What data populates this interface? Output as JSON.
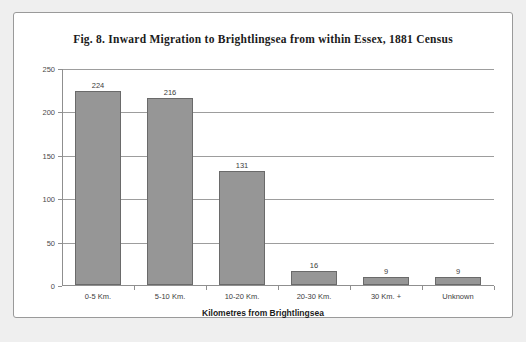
{
  "chart_data": {
    "type": "bar",
    "title": "Fig. 8. Inward Migration to Brightlingsea from within Essex, 1881 Census",
    "xlabel": "Kilometres from Brightlingsea",
    "ylabel": "",
    "categories": [
      "0-5 Km.",
      "5-10 Km.",
      "10-20 Km.",
      "20-30 Km.",
      "30 Km. +",
      "Unknown"
    ],
    "values": [
      224,
      216,
      131,
      16,
      9,
      9
    ],
    "value_labels": [
      "224",
      "216",
      "131",
      "16",
      "9",
      "9"
    ],
    "ylim": [
      0,
      250
    ],
    "yticks": [
      0,
      50,
      100,
      150,
      200,
      250
    ],
    "ytick_labels": [
      "0",
      "50",
      "100",
      "150",
      "200",
      "250"
    ],
    "grid": true,
    "legend": false,
    "bar_color": "#969696",
    "bar_border_color": "#6a6a6a",
    "gridline_color": "#9d9d9d",
    "axis_color": "#8f8f8f",
    "background": "#ffffff",
    "page_background": "#efefef"
  }
}
